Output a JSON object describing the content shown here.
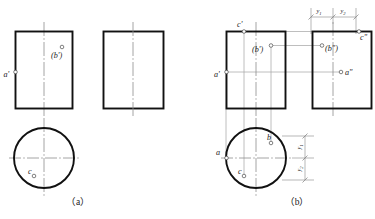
{
  "figure": {
    "title": "",
    "panels": [
      {
        "id": "a",
        "caption": "（a）",
        "views": {
          "front": {
            "name": "front-view-rect",
            "labels": [
              {
                "key": "a_front",
                "text": "a'",
                "marker": "point-circle"
              },
              {
                "key": "b_front",
                "text": "(b')",
                "marker": "point-circle"
              }
            ]
          },
          "side": {
            "name": "side-view-rect",
            "labels": []
          },
          "top": {
            "name": "top-view-circle",
            "labels": [
              {
                "key": "c_top",
                "text": "c",
                "marker": "point-circle"
              }
            ]
          }
        }
      },
      {
        "id": "b",
        "caption": "（b）",
        "views": {
          "front": {
            "name": "front-view-rect",
            "labels": [
              {
                "key": "a_front",
                "text": "a'",
                "marker": "point-circle"
              },
              {
                "key": "b_front",
                "text": "(b')",
                "marker": "point-circle"
              },
              {
                "key": "c_front",
                "text": "c'",
                "marker": "point-circle"
              }
            ]
          },
          "side": {
            "name": "side-view-rect",
            "labels": [
              {
                "key": "a_side",
                "text": "a\"",
                "marker": "point-circle"
              },
              {
                "key": "b_side",
                "text": "(b\")",
                "marker": "point-circle"
              },
              {
                "key": "c_side",
                "text": "c\"",
                "marker": "point-circle"
              }
            ]
          },
          "top": {
            "name": "top-view-circle",
            "labels": [
              {
                "key": "a_top",
                "text": "a",
                "marker": "point-circle"
              },
              {
                "key": "b_top",
                "text": "b",
                "marker": "point-circle"
              },
              {
                "key": "c_top",
                "text": "c",
                "marker": "point-circle"
              }
            ]
          }
        },
        "dimensions": {
          "horizontal": [
            {
              "key": "y1_h",
              "base": "y",
              "sub": "1"
            },
            {
              "key": "y2_h",
              "base": "y",
              "sub": "2"
            }
          ],
          "vertical": [
            {
              "key": "y1_v",
              "base": "y",
              "sub": "1"
            },
            {
              "key": "y2_v",
              "base": "y",
              "sub": "2"
            }
          ]
        }
      }
    ]
  },
  "colors": {
    "outline": "#111111",
    "projection": "#9a9a9a",
    "centerline": "#8d8d8d",
    "dimension": "#8d8d8d",
    "text": "#1a1a1a",
    "background": "#ffffff"
  },
  "labels": {
    "caption_a": "（a）",
    "caption_b": "（b）",
    "a_front_a": "a'",
    "b_front_a": "(b')",
    "c_top_a": "c",
    "a_front_b": "a'",
    "b_front_b": "(b')",
    "c_front_b": "c'",
    "a_side_b": "a\"",
    "b_side_b": "(b\")",
    "c_side_b": "c\"",
    "a_top_b": "a",
    "b_top_b": "b",
    "c_top_b": "c",
    "dim_y_base": "y",
    "dim_sub_1": "1",
    "dim_sub_2": "2"
  }
}
